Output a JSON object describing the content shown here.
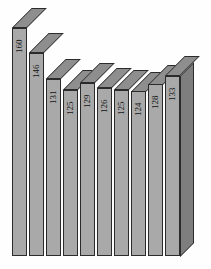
{
  "chart_data": {
    "type": "bar",
    "title": "",
    "subtitle": "",
    "xlabel": "",
    "ylabel": "",
    "categories": [
      "Sc",
      "Ti",
      "V",
      "Cr",
      "Mn",
      "Fe",
      "Co",
      "Ni",
      "Cu",
      "Zn"
    ],
    "values": [
      160,
      146,
      131,
      125,
      129,
      126,
      125,
      124,
      128,
      133
    ],
    "data_labels": [
      "160",
      "146",
      "131",
      "125",
      "129",
      "126",
      "125",
      "124",
      "128",
      "133"
    ],
    "ylim": [
      0,
      160
    ],
    "grid": false,
    "legend": null,
    "legend_position": "none",
    "orientation": "vertical",
    "three_d": true,
    "annotations": []
  },
  "style": {
    "background": "#fefefe",
    "bar_face": "#a9a9a9",
    "bar_top": "#8e8e8e",
    "bar_side": "#7e7e7e",
    "outline": "#2b2b2b",
    "text": "#111111"
  }
}
